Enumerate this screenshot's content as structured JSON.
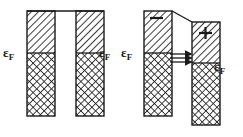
{
  "figure": {
    "panels": [
      {
        "name": "equilibrium-junction",
        "description": "Two metal electrodes separated by a vacuum/insulator barrier at zero bias; Fermi levels aligned.",
        "bias": "none",
        "electrodes": [
          {
            "side": "left",
            "fermi_label": "ε",
            "fermi_subscript": "F",
            "fermi_label_position": "left",
            "polarity": "",
            "filled_fill": "crosshatch",
            "empty_fill": "diagonal-hatch"
          },
          {
            "side": "right",
            "fermi_label": "ε",
            "fermi_subscript": "F",
            "fermi_label_position": "right",
            "polarity": "",
            "filled_fill": "crosshatch",
            "empty_fill": "diagonal-hatch"
          }
        ],
        "barrier_shape": "flat",
        "tunneling_arrows": 0
      },
      {
        "name": "biased-junction",
        "description": "Two metal electrodes under applied bias; barrier top tilts, Fermi levels offset, electrons tunnel left to right.",
        "bias": "applied",
        "electrodes": [
          {
            "side": "left",
            "fermi_label": "ε",
            "fermi_subscript": "F",
            "fermi_label_position": "left",
            "polarity": "−",
            "filled_fill": "crosshatch",
            "empty_fill": "diagonal-hatch"
          },
          {
            "side": "right",
            "fermi_label": "ε",
            "fermi_subscript": "F",
            "fermi_label_position": "right",
            "polarity": "+",
            "filled_fill": "crosshatch",
            "empty_fill": "diagonal-hatch"
          }
        ],
        "barrier_shape": "tilted",
        "tunneling_arrows": 3,
        "arrow_direction": "left-to-right"
      }
    ],
    "colors": {
      "ink": "#1a1a1a",
      "background": "#ffffff",
      "hatch": "#1a1a1a"
    }
  }
}
